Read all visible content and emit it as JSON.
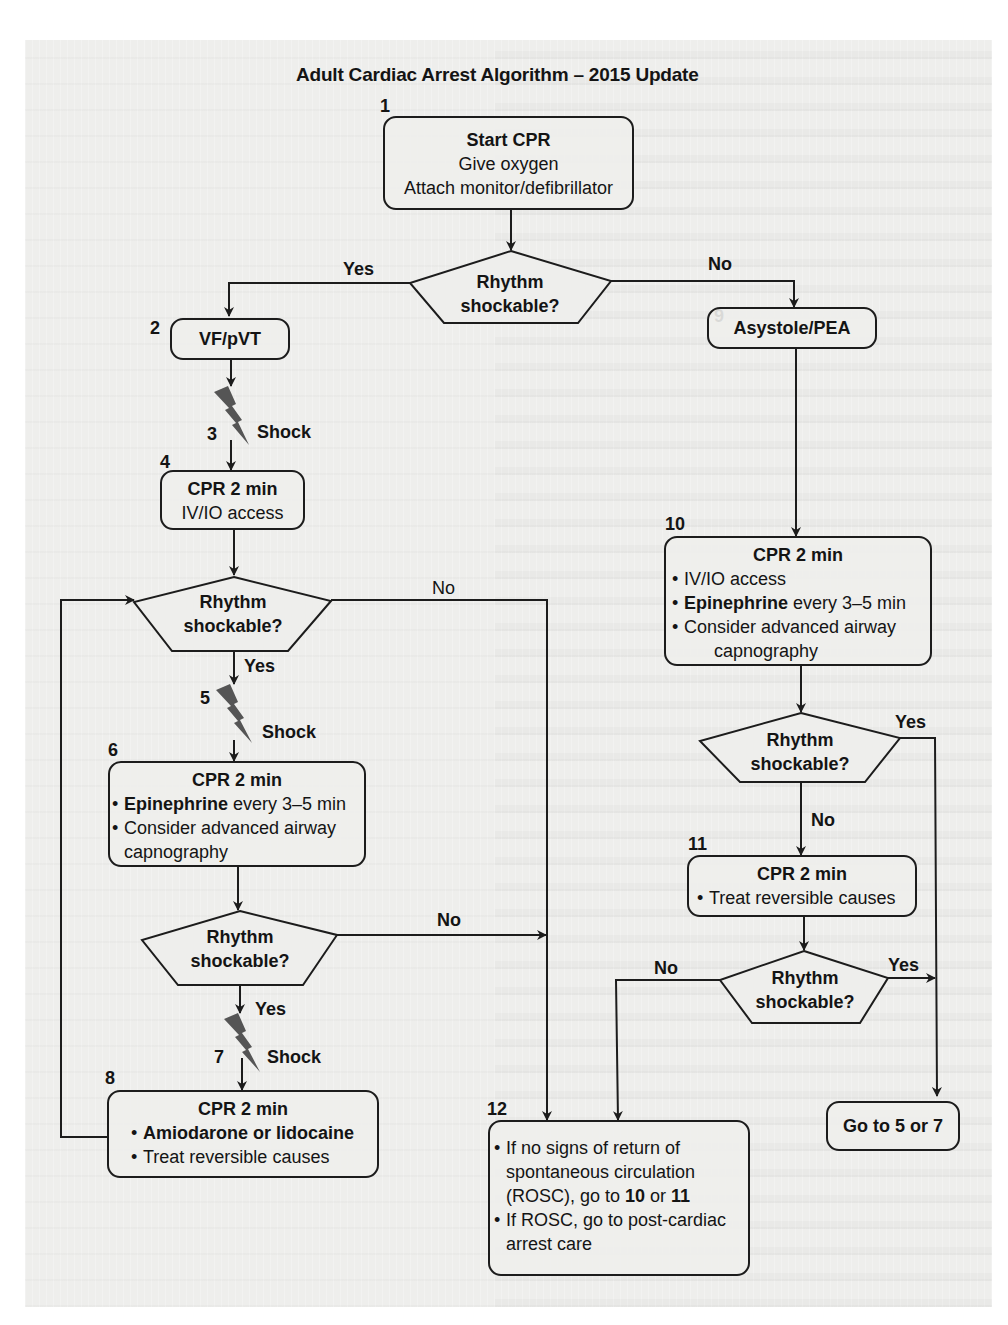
{
  "title": "Adult Cardiac Arrest Algorithm – 2015 Update",
  "colors": {
    "page_background": "#eeeeec",
    "line": "#1c1c1c",
    "shock_bolt": "#555555"
  },
  "nodes": {
    "n1": {
      "number": "1",
      "heading": "Start CPR",
      "lines": [
        "Give oxygen",
        "Attach monitor/defibrillator"
      ]
    },
    "d1": {
      "text_line1": "Rhythm",
      "text_line2": "shockable?",
      "yes_label": "Yes",
      "no_label": "No"
    },
    "n2": {
      "number": "2",
      "heading": "VF/pVT"
    },
    "n3": {
      "number": "3",
      "label": "Shock",
      "icon": "lightning-bolt-icon"
    },
    "n4": {
      "number": "4",
      "heading": "CPR 2 min",
      "lines": [
        "IV/IO access"
      ]
    },
    "d2": {
      "text_line1": "Rhythm",
      "text_line2": "shockable?",
      "yes_label": "Yes",
      "no_label": "No"
    },
    "n5": {
      "number": "5",
      "label": "Shock",
      "icon": "lightning-bolt-icon"
    },
    "n6": {
      "number": "6",
      "heading": "CPR 2 min",
      "bullets": [
        {
          "bold": "Epinephrine",
          "rest": " every 3–5 min"
        },
        {
          "bold": "",
          "rest": "Consider advanced airway",
          "cont": "capnography"
        }
      ]
    },
    "d3": {
      "text_line1": "Rhythm",
      "text_line2": "shockable?",
      "yes_label": "Yes",
      "no_label": "No"
    },
    "n7": {
      "number": "7",
      "label": "Shock",
      "icon": "lightning-bolt-icon"
    },
    "n8": {
      "number": "8",
      "heading": "CPR 2 min",
      "bullets": [
        {
          "bold": "Amiodarone or lidocaine",
          "rest": ""
        },
        {
          "bold": "",
          "rest": "Treat reversible causes"
        }
      ]
    },
    "n9": {
      "number": "9",
      "heading": "Asystole/PEA"
    },
    "n10": {
      "number": "10",
      "heading": "CPR 2 min",
      "bullets": [
        {
          "bold": "",
          "rest": "IV/IO access"
        },
        {
          "bold": "Epinephrine",
          "rest": " every 3–5 min"
        },
        {
          "bold": "",
          "rest": "Consider advanced airway",
          "cont": "capnography"
        }
      ]
    },
    "d4": {
      "text_line1": "Rhythm",
      "text_line2": "shockable?",
      "yes_label": "Yes",
      "no_label": "No"
    },
    "n11": {
      "number": "11",
      "heading": "CPR 2 min",
      "bullets": [
        {
          "bold": "",
          "rest": "Treat reversible causes"
        }
      ]
    },
    "d5": {
      "text_line1": "Rhythm",
      "text_line2": "shockable?",
      "yes_label": "Yes",
      "no_label": "No"
    },
    "goto": {
      "text": "Go to 5 or 7"
    },
    "n12": {
      "number": "12",
      "bullet1_pre": "If no signs of return of",
      "bullet1_l2": "spontaneous circulation",
      "bullet1_l3_pre": "(ROSC), go to ",
      "bullet1_ref1": "10",
      "bullet1_mid": " or ",
      "bullet1_ref2": "11",
      "bullet2_l1": "If ROSC, go to post-cardiac",
      "bullet2_l2": "arrest care"
    }
  }
}
